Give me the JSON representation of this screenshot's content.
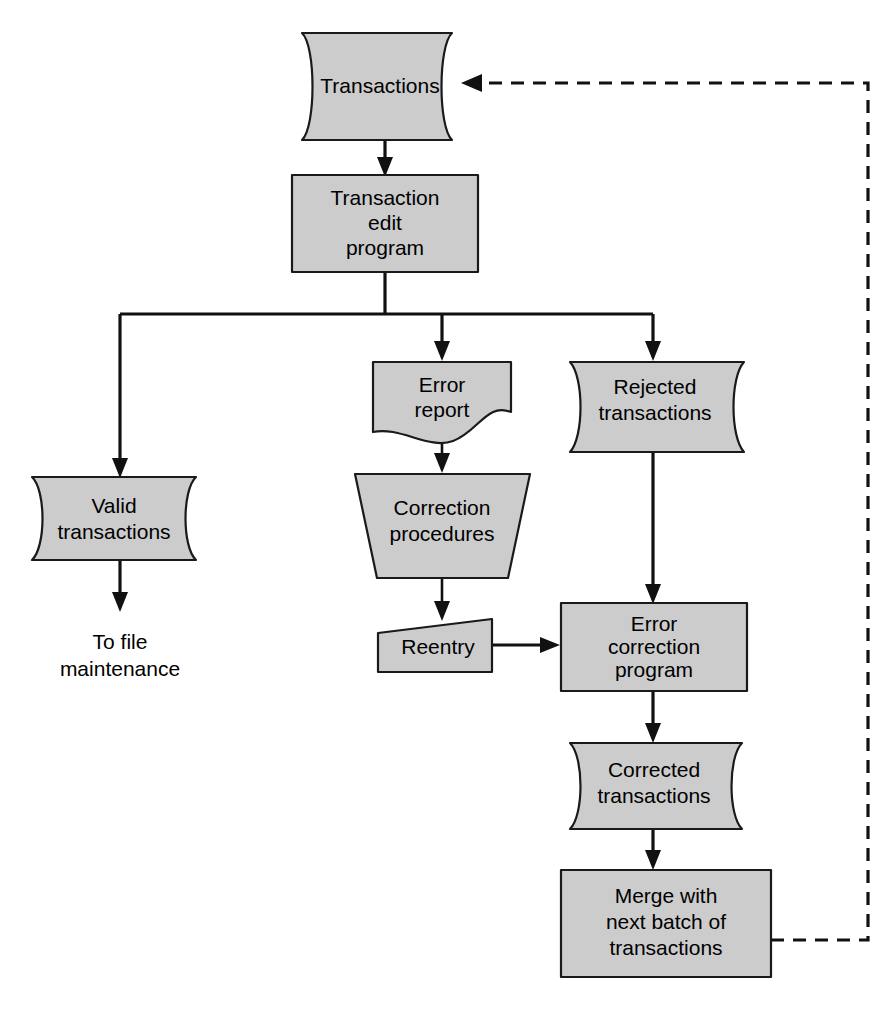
{
  "diagram": {
    "canvas": {
      "width": 893,
      "height": 1023
    },
    "style": {
      "shape_fill": "#cccccc",
      "shape_stroke": "#1a1a1a",
      "connector_color": "#111111",
      "background": "#ffffff"
    },
    "nodes": [
      {
        "id": "transactions",
        "label": "Transactions",
        "shape": "magnetic-tape-file",
        "line1": "Transactions",
        "line2": ""
      },
      {
        "id": "transaction-edit-program",
        "label": "Transaction edit program",
        "shape": "process-rectangle",
        "line1": "Transaction",
        "line2": "edit",
        "line3": "program"
      },
      {
        "id": "valid-transactions",
        "label": "Valid transactions",
        "shape": "magnetic-tape-file",
        "line1": "Valid",
        "line2": "transactions"
      },
      {
        "id": "error-report",
        "label": "Error report",
        "shape": "document",
        "line1": "Error",
        "line2": "report"
      },
      {
        "id": "rejected-transactions",
        "label": "Rejected transactions",
        "shape": "magnetic-tape-file",
        "line1": "Rejected",
        "line2": "transactions"
      },
      {
        "id": "correction-procedures",
        "label": "Correction procedures",
        "shape": "manual-operation-trapezoid",
        "line1": "Correction",
        "line2": "procedures"
      },
      {
        "id": "reentry",
        "label": "Reentry",
        "shape": "manual-input",
        "line1": "Reentry",
        "line2": ""
      },
      {
        "id": "error-correction-program",
        "label": "Error correction program",
        "shape": "process-rectangle",
        "line1": "Error",
        "line2": "correction",
        "line3": "program"
      },
      {
        "id": "corrected-transactions",
        "label": "Corrected transactions",
        "shape": "magnetic-tape-file",
        "line1": "Corrected",
        "line2": "transactions"
      },
      {
        "id": "merge-with-next-batch",
        "label": "Merge with next batch of transactions",
        "shape": "process-rectangle",
        "line1": "Merge with",
        "line2": "next batch of",
        "line3": "transactions"
      }
    ],
    "free_text": [
      {
        "id": "to-file-maintenance",
        "line1": "To file",
        "line2": "maintenance"
      }
    ],
    "edges": [
      {
        "id": "e1",
        "from": "transactions",
        "to": "transaction-edit-program",
        "style": "solid"
      },
      {
        "id": "e2",
        "from": "transaction-edit-program",
        "to": "valid-transactions",
        "style": "solid"
      },
      {
        "id": "e3",
        "from": "transaction-edit-program",
        "to": "error-report",
        "style": "solid"
      },
      {
        "id": "e4",
        "from": "transaction-edit-program",
        "to": "rejected-transactions",
        "style": "solid"
      },
      {
        "id": "e5",
        "from": "valid-transactions",
        "to": "to-file-maintenance",
        "style": "solid"
      },
      {
        "id": "e6",
        "from": "error-report",
        "to": "correction-procedures",
        "style": "solid"
      },
      {
        "id": "e7",
        "from": "correction-procedures",
        "to": "reentry",
        "style": "solid"
      },
      {
        "id": "e8",
        "from": "reentry",
        "to": "error-correction-program",
        "style": "solid"
      },
      {
        "id": "e9",
        "from": "rejected-transactions",
        "to": "error-correction-program",
        "style": "solid"
      },
      {
        "id": "e10",
        "from": "error-correction-program",
        "to": "corrected-transactions",
        "style": "solid"
      },
      {
        "id": "e11",
        "from": "corrected-transactions",
        "to": "merge-with-next-batch",
        "style": "solid"
      },
      {
        "id": "e12",
        "from": "merge-with-next-batch",
        "to": "transactions",
        "style": "dashed"
      }
    ]
  }
}
